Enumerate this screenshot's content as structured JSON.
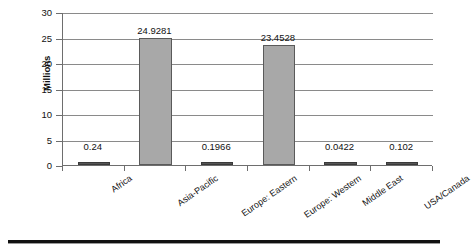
{
  "chart_data": {
    "type": "bar",
    "title": "",
    "xlabel": "",
    "ylabel": "Millions",
    "ylim": [
      0,
      30
    ],
    "ytick_step": 5,
    "grid": true,
    "legend": "none",
    "categories": [
      "Africa",
      "Asia-Pacific",
      "Europe: Eastern",
      "Europe: Western",
      "Middle East",
      "USA/Canada"
    ],
    "values": [
      0.24,
      24.9281,
      0.1966,
      23.4528,
      0.0422,
      0.102
    ],
    "value_labels": [
      "0.24",
      "24.9281",
      "0.1966",
      "23.4528",
      "0.0422",
      "0.102"
    ],
    "ytick_labels": [
      "0",
      "5",
      "10",
      "15",
      "20",
      "25",
      "30"
    ],
    "bar_color": "#a8a8a8",
    "bar_edge_color": "#5a5a5a",
    "grid_color": "#8a8a8a",
    "axis_color": "#6e6e6e"
  }
}
